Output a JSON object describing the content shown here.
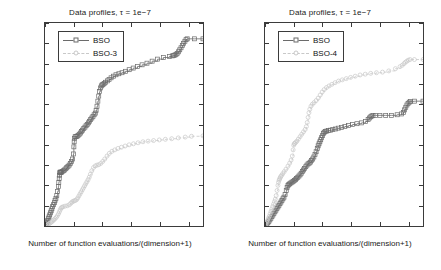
{
  "figure": {
    "axis_color": "#3b3b3b",
    "series_colors": {
      "bso": "#6b6b6b",
      "variant_light": "#c8c8c8"
    }
  },
  "common": {
    "title": "Data profiles, τ = 1e−7",
    "xlabel": "Number of function evaluations/(dimension+1)",
    "ylabel": "Proportion of problems solved",
    "ytick_labels": [
      "0",
      "0.1",
      "0.2",
      "0.3",
      "0.4",
      "0.5",
      "0.6",
      "0.7",
      "0.8",
      "0.9",
      "1"
    ],
    "xtick_labels": [
      "0",
      "2000",
      "4000",
      "6000",
      "8000",
      "10000"
    ]
  },
  "chart_data": [
    {
      "type": "line",
      "panel": "left",
      "title": "Data profiles, τ = 1e−7",
      "xlabel": "Number of function evaluations/(dimension+1)",
      "ylabel": "Proportion of problems solved",
      "xlim": [
        0,
        11000
      ],
      "ylim": [
        0,
        1
      ],
      "xticks": [
        0,
        2000,
        4000,
        6000,
        8000,
        10000
      ],
      "yticks": [
        0,
        0.1,
        0.2,
        0.3,
        0.4,
        0.5,
        0.6,
        0.7,
        0.8,
        0.9,
        1
      ],
      "grid": false,
      "legend_position": "upper left",
      "series": [
        {
          "name": "BSO",
          "marker": "square",
          "line": "solid",
          "color": "#6b6b6b",
          "x": [
            60,
            110,
            150,
            190,
            230,
            280,
            330,
            380,
            430,
            480,
            530,
            590,
            650,
            700,
            760,
            820,
            880,
            930,
            960,
            990,
            1010,
            1030,
            1050,
            1080,
            1110,
            1150,
            1200,
            1280,
            1360,
            1450,
            1520,
            1600,
            1680,
            1760,
            1840,
            1920,
            1980,
            2010,
            2030,
            2060,
            2100,
            2160,
            2230,
            2300,
            2380,
            2460,
            2540,
            2620,
            2700,
            2780,
            2860,
            2940,
            3020,
            3100,
            3180,
            3260,
            3340,
            3420,
            3500,
            3560,
            3620,
            3680,
            3740,
            3800,
            3860,
            3920,
            3980,
            4040,
            4120,
            4220,
            4340,
            4460,
            4600,
            4760,
            4940,
            5140,
            5360,
            5600,
            5860,
            6140,
            6440,
            6760,
            7100,
            7460,
            7840,
            8240,
            8660,
            8860,
            8960,
            9040,
            9120,
            9200,
            9290,
            9380,
            9470,
            9560,
            9650,
            9740,
            9820,
            9900,
            10400,
            11000
          ],
          "y": [
            0.005,
            0.012,
            0.02,
            0.028,
            0.036,
            0.045,
            0.055,
            0.065,
            0.075,
            0.085,
            0.095,
            0.105,
            0.115,
            0.125,
            0.135,
            0.15,
            0.17,
            0.195,
            0.215,
            0.235,
            0.25,
            0.262,
            0.265,
            0.265,
            0.265,
            0.265,
            0.268,
            0.272,
            0.276,
            0.282,
            0.288,
            0.294,
            0.3,
            0.308,
            0.318,
            0.33,
            0.355,
            0.39,
            0.415,
            0.432,
            0.44,
            0.44,
            0.442,
            0.446,
            0.452,
            0.458,
            0.465,
            0.472,
            0.48,
            0.487,
            0.494,
            0.5,
            0.508,
            0.516,
            0.524,
            0.532,
            0.54,
            0.548,
            0.556,
            0.57,
            0.59,
            0.615,
            0.64,
            0.662,
            0.68,
            0.69,
            0.695,
            0.698,
            0.702,
            0.708,
            0.715,
            0.722,
            0.73,
            0.738,
            0.745,
            0.75,
            0.755,
            0.762,
            0.77,
            0.778,
            0.786,
            0.794,
            0.802,
            0.812,
            0.822,
            0.83,
            0.835,
            0.838,
            0.84,
            0.842,
            0.845,
            0.85,
            0.858,
            0.868,
            0.878,
            0.89,
            0.9,
            0.91,
            0.918,
            0.922,
            0.922,
            0.922
          ]
        },
        {
          "name": "BSO-3",
          "marker": "circle",
          "line": "dashed",
          "color": "#c8c8c8",
          "x": [
            60,
            140,
            220,
            300,
            380,
            460,
            540,
            620,
            700,
            780,
            860,
            940,
            1000,
            1060,
            1120,
            1180,
            1260,
            1400,
            1560,
            1700,
            1800,
            1880,
            1960,
            2040,
            2120,
            2200,
            2280,
            2360,
            2440,
            2520,
            2600,
            2680,
            2760,
            2840,
            2920,
            3000,
            3080,
            3160,
            3260,
            3380,
            3500,
            3620,
            3740,
            3880,
            4020,
            4160,
            4320,
            4480,
            4660,
            4860,
            5080,
            5320,
            5580,
            5860,
            6160,
            6480,
            6820,
            7180,
            7560,
            7960,
            8380,
            8820,
            9280,
            9760,
            10200,
            11000
          ],
          "y": [
            0.002,
            0.005,
            0.008,
            0.012,
            0.016,
            0.02,
            0.025,
            0.03,
            0.036,
            0.042,
            0.05,
            0.06,
            0.07,
            0.08,
            0.088,
            0.092,
            0.095,
            0.098,
            0.1,
            0.105,
            0.112,
            0.118,
            0.122,
            0.124,
            0.126,
            0.13,
            0.138,
            0.148,
            0.158,
            0.168,
            0.178,
            0.188,
            0.198,
            0.208,
            0.218,
            0.228,
            0.24,
            0.255,
            0.272,
            0.288,
            0.296,
            0.3,
            0.302,
            0.308,
            0.318,
            0.33,
            0.345,
            0.358,
            0.368,
            0.375,
            0.382,
            0.388,
            0.394,
            0.4,
            0.405,
            0.41,
            0.415,
            0.418,
            0.421,
            0.424,
            0.427,
            0.43,
            0.434,
            0.438,
            0.442,
            0.444
          ]
        }
      ]
    },
    {
      "type": "line",
      "panel": "right",
      "title": "Data profiles, τ = 1e−7",
      "xlabel": "Number of function evaluations/(dimension+1)",
      "ylabel": "Proportion of problems solved",
      "xlim": [
        0,
        11000
      ],
      "ylim": [
        0,
        1
      ],
      "xticks": [
        0,
        2000,
        4000,
        6000,
        8000,
        10000
      ],
      "yticks": [
        0,
        0.1,
        0.2,
        0.3,
        0.4,
        0.5,
        0.6,
        0.7,
        0.8,
        0.9,
        1
      ],
      "grid": false,
      "legend_position": "upper left",
      "series": [
        {
          "name": "BSO",
          "marker": "square",
          "line": "solid",
          "color": "#6b6b6b",
          "x": [
            60,
            130,
            200,
            270,
            340,
            410,
            480,
            550,
            620,
            690,
            760,
            830,
            900,
            970,
            1040,
            1110,
            1180,
            1250,
            1320,
            1400,
            1480,
            1540,
            1600,
            1660,
            1720,
            1800,
            1880,
            1960,
            2040,
            2120,
            2200,
            2280,
            2360,
            2440,
            2520,
            2600,
            2680,
            2760,
            2840,
            2920,
            3000,
            3080,
            3160,
            3240,
            3320,
            3400,
            3480,
            3560,
            3640,
            3700,
            3760,
            3820,
            3880,
            3940,
            4000,
            4060,
            4120,
            4200,
            4300,
            4420,
            4560,
            4720,
            4900,
            5100,
            5320,
            5560,
            5820,
            6100,
            6400,
            6720,
            7000,
            7180,
            7280,
            7360,
            7440,
            7520,
            7700,
            8000,
            8400,
            8800,
            9200,
            9500,
            9640,
            9720,
            9800,
            9880,
            9960,
            10040,
            10120,
            10400,
            11000
          ],
          "y": [
            0.004,
            0.01,
            0.016,
            0.022,
            0.03,
            0.038,
            0.046,
            0.054,
            0.062,
            0.07,
            0.078,
            0.086,
            0.094,
            0.102,
            0.11,
            0.118,
            0.126,
            0.134,
            0.142,
            0.155,
            0.175,
            0.19,
            0.2,
            0.205,
            0.208,
            0.212,
            0.216,
            0.22,
            0.224,
            0.228,
            0.234,
            0.24,
            0.246,
            0.252,
            0.26,
            0.268,
            0.276,
            0.284,
            0.292,
            0.3,
            0.306,
            0.31,
            0.315,
            0.322,
            0.33,
            0.34,
            0.352,
            0.366,
            0.382,
            0.395,
            0.405,
            0.415,
            0.425,
            0.435,
            0.445,
            0.455,
            0.462,
            0.466,
            0.468,
            0.47,
            0.472,
            0.475,
            0.478,
            0.482,
            0.486,
            0.49,
            0.495,
            0.5,
            0.504,
            0.508,
            0.515,
            0.525,
            0.532,
            0.538,
            0.542,
            0.545,
            0.545,
            0.545,
            0.545,
            0.545,
            0.548,
            0.552,
            0.56,
            0.572,
            0.585,
            0.596,
            0.604,
            0.61,
            0.614,
            0.615,
            0.615,
            0.615
          ]
        },
        {
          "name": "BSO-4",
          "marker": "circle",
          "line": "dashed",
          "color": "#c8c8c8",
          "x": [
            60,
            120,
            180,
            240,
            300,
            360,
            420,
            480,
            540,
            600,
            660,
            720,
            780,
            840,
            900,
            940,
            980,
            1020,
            1060,
            1100,
            1160,
            1240,
            1340,
            1460,
            1600,
            1720,
            1820,
            1900,
            1960,
            2000,
            2040,
            2080,
            2140,
            2220,
            2320,
            2440,
            2560,
            2680,
            2800,
            2880,
            2940,
            3000,
            3060,
            3120,
            3200,
            3300,
            3420,
            3560,
            3700,
            3840,
            3980,
            4120,
            4280,
            4460,
            4660,
            4880,
            5120,
            5380,
            5660,
            5960,
            6280,
            6620,
            6980,
            7360,
            7760,
            8180,
            8620,
            9080,
            9400,
            9560,
            9680,
            9780,
            9880,
            9980,
            10100,
            10400,
            11000
          ],
          "y": [
            0.008,
            0.018,
            0.028,
            0.038,
            0.048,
            0.06,
            0.072,
            0.084,
            0.096,
            0.108,
            0.12,
            0.132,
            0.15,
            0.175,
            0.2,
            0.215,
            0.225,
            0.232,
            0.238,
            0.244,
            0.25,
            0.258,
            0.268,
            0.28,
            0.295,
            0.31,
            0.325,
            0.345,
            0.375,
            0.398,
            0.405,
            0.408,
            0.412,
            0.418,
            0.428,
            0.44,
            0.452,
            0.464,
            0.476,
            0.49,
            0.51,
            0.535,
            0.558,
            0.575,
            0.59,
            0.6,
            0.608,
            0.618,
            0.63,
            0.645,
            0.66,
            0.672,
            0.682,
            0.69,
            0.698,
            0.706,
            0.714,
            0.72,
            0.726,
            0.732,
            0.738,
            0.744,
            0.748,
            0.752,
            0.755,
            0.758,
            0.764,
            0.775,
            0.785,
            0.792,
            0.8,
            0.807,
            0.812,
            0.817,
            0.82,
            0.82,
            0.82
          ]
        }
      ]
    }
  ]
}
